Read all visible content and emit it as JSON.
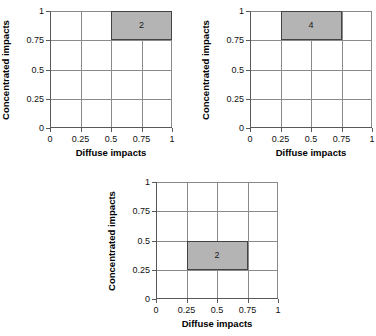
{
  "figure": {
    "background": "#ffffff",
    "grid_color": "#8a8a8a",
    "axis_color": "#595959",
    "region_fill": "#b4b4b4",
    "region_border": "#434343"
  },
  "chart_data": [
    {
      "type": "heatmap",
      "title": "",
      "xlabel": "Diffuse impacts",
      "ylabel": "Concentrated impacts",
      "xlim": [
        0,
        1
      ],
      "ylim": [
        0,
        1
      ],
      "xticks": [
        "0",
        "0.25",
        "0.5",
        "0.75",
        "1"
      ],
      "yticks": [
        "0",
        "0.25",
        "0.5",
        "0.75",
        "1"
      ],
      "xtick_values": [
        0,
        0.25,
        0.5,
        0.75,
        1
      ],
      "ytick_values": [
        0,
        0.25,
        0.5,
        0.75,
        1
      ],
      "grid": true,
      "legend": "none",
      "regions": [
        {
          "x0": 0.5,
          "x1": 1.0,
          "y0": 0.75,
          "y1": 1.0,
          "count": "2"
        }
      ]
    },
    {
      "type": "heatmap",
      "title": "",
      "xlabel": "Diffuse impacts",
      "ylabel": "Concentrated impacts",
      "xlim": [
        0,
        1
      ],
      "ylim": [
        0,
        1
      ],
      "xticks": [
        "0",
        "0.25",
        "0.5",
        "0.75",
        "1"
      ],
      "yticks": [
        "0",
        "0.25",
        "0.5",
        "0.75",
        "1"
      ],
      "xtick_values": [
        0,
        0.25,
        0.5,
        0.75,
        1
      ],
      "ytick_values": [
        0,
        0.25,
        0.5,
        0.75,
        1
      ],
      "grid": true,
      "legend": "none",
      "regions": [
        {
          "x0": 0.25,
          "x1": 0.75,
          "y0": 0.75,
          "y1": 1.0,
          "count": "4"
        }
      ]
    },
    {
      "type": "heatmap",
      "title": "",
      "xlabel": "Diffuse impacts",
      "ylabel": "Concentrated impacts",
      "xlim": [
        0,
        1
      ],
      "ylim": [
        0,
        1
      ],
      "xticks": [
        "0",
        "0.25",
        "0.5",
        "0.75",
        "1"
      ],
      "yticks": [
        "0",
        "0.25",
        "0.5",
        "0.75",
        "1"
      ],
      "xtick_values": [
        0,
        0.25,
        0.5,
        0.75,
        1
      ],
      "ytick_values": [
        0,
        0.25,
        0.5,
        0.75,
        1
      ],
      "grid": true,
      "legend": "none",
      "regions": [
        {
          "x0": 0.25,
          "x1": 0.75,
          "y0": 0.25,
          "y1": 0.5,
          "count": "2"
        }
      ]
    }
  ]
}
